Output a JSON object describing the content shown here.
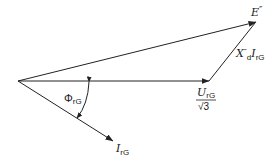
{
  "diagram": {
    "type": "phasor-diagram",
    "colors": {
      "line": "#222222",
      "background": "#ffffff"
    },
    "vectors": [
      {
        "id": "E",
        "from": [
          18,
          81
        ],
        "to": [
          256,
          22
        ]
      },
      {
        "id": "U",
        "from": [
          18,
          81
        ],
        "to": [
          209,
          81
        ]
      },
      {
        "id": "XI",
        "from": [
          209,
          81
        ],
        "to": [
          256,
          22
        ]
      },
      {
        "id": "I",
        "from": [
          18,
          81
        ],
        "to": [
          113,
          141
        ]
      }
    ],
    "labels": {
      "e_main": "E",
      "e_prime": "″",
      "xi_main": "X",
      "xi_prime": "″",
      "xi_sub_d": "d",
      "xi_i": "I",
      "xi_sub_rg": "rG",
      "u_main": "U",
      "u_sub": "rG",
      "u_den": "√3",
      "phi_main": "Φ",
      "phi_sub": "rG",
      "i_main": "I",
      "i_sub": "rG"
    }
  }
}
